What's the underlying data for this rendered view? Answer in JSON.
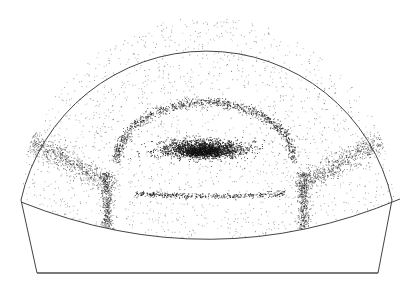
{
  "figure": {
    "kind": "density-map",
    "colors": {
      "background": "#ffffff",
      "outline": "#444444",
      "dots": "#111111"
    },
    "outline": {
      "dome_top": [
        205,
        14
      ],
      "left_shoulder": [
        21,
        200
      ],
      "right_shoulder": [
        392,
        200
      ],
      "bottom_left": [
        37,
        273
      ],
      "bottom_right": [
        378,
        273
      ],
      "chord_left": [
        21,
        202
      ],
      "chord_mid": [
        212,
        240
      ],
      "chord_right": [
        400,
        199
      ]
    },
    "features": [
      {
        "name": "central-core",
        "cx": 203,
        "cy": 150,
        "rx": 48,
        "ry": 9,
        "density": 1.0
      },
      {
        "name": "inner-ring",
        "cx": 205,
        "cy": 160,
        "rx": 88,
        "ry": 58,
        "density": 0.45
      },
      {
        "name": "ring-bottom-line",
        "y": 199,
        "x_from": 135,
        "x_to": 285,
        "density": 0.5
      },
      {
        "name": "left-vertical-band",
        "x": 107,
        "y_from": 172,
        "y_to": 232,
        "density": 0.35
      },
      {
        "name": "right-vertical-band",
        "x": 303,
        "y_from": 172,
        "y_to": 232,
        "density": 0.35
      },
      {
        "name": "left-diagonal-band",
        "from": [
          30,
          140
        ],
        "to": [
          110,
          185
        ],
        "density": 0.3
      },
      {
        "name": "right-diagonal-band",
        "from": [
          300,
          185
        ],
        "to": [
          380,
          140
        ],
        "density": 0.3
      }
    ]
  }
}
